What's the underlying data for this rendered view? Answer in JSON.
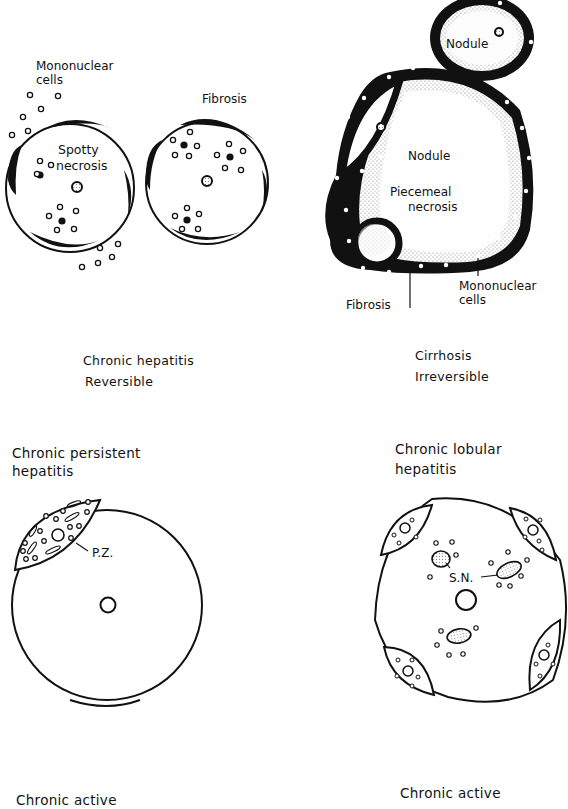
{
  "panels": {
    "chronic_hepatitis": {
      "labels": {
        "mononuclear_1": "Mononuclear",
        "mononuclear_2": "cells",
        "spotty_1": "Spotty",
        "spotty_2": "necrosis",
        "fibrosis": "Fibrosis"
      },
      "caption_1": "Chronic hepatitis",
      "caption_2": "Reversible"
    },
    "cirrhosis": {
      "labels": {
        "nodule_top": "Nodule",
        "nodule_main": "Nodule",
        "piecemeal_1": "Piecemeal",
        "piecemeal_2": "necrosis",
        "fibrosis": "Fibrosis",
        "mononuclear_1": "Mononuclear",
        "mononuclear_2": "cells"
      },
      "caption_1": "Cirrhosis",
      "caption_2": "Irreversible"
    },
    "chronic_persistent": {
      "title_1": "Chronic persistent",
      "title_2": "hepatitis",
      "labels": {
        "pz": "P.Z."
      }
    },
    "chronic_lobular": {
      "title_1": "Chronic lobular",
      "title_2": "hepatitis",
      "labels": {
        "sn": "S.N."
      }
    },
    "bottom": {
      "left_title": "Chronic active",
      "right_title": "Chronic active"
    }
  },
  "colors": {
    "ink": "#111111",
    "background": "#ffffff",
    "shade": "#9a9a9a"
  }
}
